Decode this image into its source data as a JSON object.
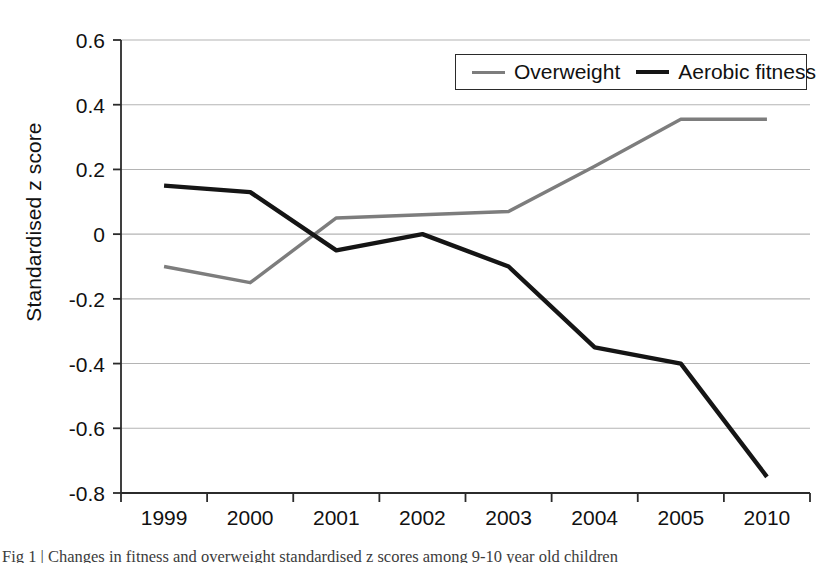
{
  "figure": {
    "caption": "Fig 1 | Changes in fitness and overweight standardised z scores among 9-10 year old children"
  },
  "legend": {
    "position": "top-right-inside",
    "entries": [
      {
        "label": "Overweight",
        "color": "#7d7d7d",
        "icon": "line-swatch-icon"
      },
      {
        "label": "Aerobic fitness",
        "color": "#151515",
        "icon": "line-swatch-icon"
      }
    ]
  },
  "axes": {
    "y_title": "Standardised z score",
    "y_ticks": [
      "0.6",
      "0.4",
      "0.2",
      "0",
      "-0.2",
      "-0.4",
      "-0.6",
      "-0.8"
    ],
    "x_ticks": [
      "1999",
      "2000",
      "2001",
      "2002",
      "2003",
      "2004",
      "2005",
      "2010"
    ]
  },
  "chart_data": {
    "type": "line",
    "title": "",
    "xlabel": "",
    "ylabel": "Standardised z score",
    "categories": [
      "1999",
      "2000",
      "2001",
      "2002",
      "2003",
      "2004",
      "2005",
      "2010"
    ],
    "ylim": [
      -0.8,
      0.6
    ],
    "ytick_values": [
      0.6,
      0.4,
      0.2,
      0,
      -0.2,
      -0.4,
      -0.6,
      -0.8
    ],
    "grid": "horizontal",
    "legend_position": "upper right",
    "series": [
      {
        "name": "Overweight",
        "color": "#7d7d7d",
        "values": [
          -0.1,
          -0.15,
          0.05,
          0.06,
          0.07,
          0.21,
          0.355,
          0.355
        ]
      },
      {
        "name": "Aerobic fitness",
        "color": "#151515",
        "values": [
          0.15,
          0.13,
          -0.05,
          0.0,
          -0.1,
          -0.35,
          -0.4,
          -0.75
        ]
      }
    ]
  }
}
